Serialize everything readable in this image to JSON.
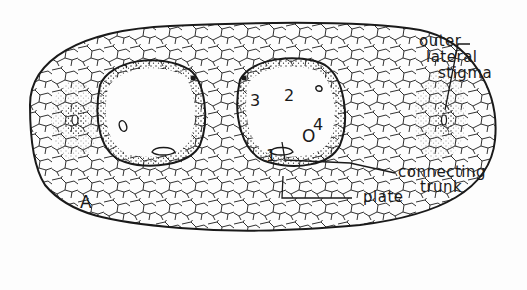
{
  "figure": {
    "panel_label": "A",
    "labels": {
      "outer_lateral_stigma": [
        "outer",
        "lateral",
        "stigma"
      ],
      "connecting_trunk": [
        "connecting",
        "trunk"
      ],
      "plate": "plate"
    },
    "numbers": [
      "1",
      "2",
      "3",
      "4"
    ],
    "openings": [
      "O",
      "O"
    ]
  },
  "colors": {
    "ink": "#1a1a1a",
    "background": "#fdfdfd"
  }
}
